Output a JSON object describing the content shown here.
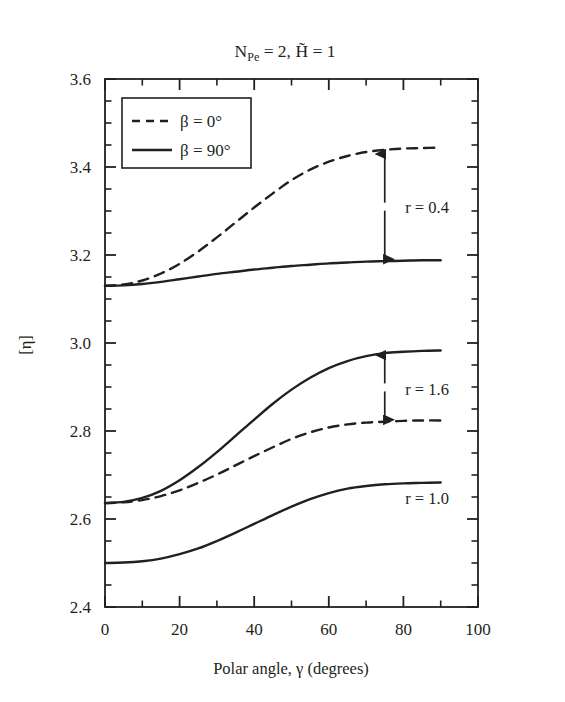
{
  "chart_data": {
    "type": "line",
    "title_parts": {
      "n_main": "N",
      "n_sub": "Pe",
      "n_eq": " = 2, ",
      "h_main": "H̃",
      "h_eq": " = 1"
    },
    "xlabel": "Polar angle, γ (degrees)",
    "ylabel": "[η]",
    "xlim": [
      0,
      100
    ],
    "ylim": [
      2.4,
      3.6
    ],
    "x_major_ticks": [
      0,
      20,
      40,
      60,
      80,
      100
    ],
    "x_tick_labels": [
      "0",
      "20",
      "40",
      "60",
      "80",
      "100"
    ],
    "x_minor_step": 10,
    "y_major_ticks": [
      2.4,
      2.6,
      2.8,
      3.0,
      3.2,
      3.4,
      3.6
    ],
    "y_tick_labels": [
      "2.4",
      "2.6",
      "2.8",
      "3.0",
      "3.2",
      "3.4",
      "3.6"
    ],
    "y_minor_step": 0.05,
    "grid": false,
    "legend_position": "upper left (inside axes)",
    "legend": [
      {
        "label": "β = 0°",
        "style": "dashed"
      },
      {
        "label": "β = 90°",
        "style": "solid"
      }
    ],
    "x": [
      0,
      5,
      10,
      15,
      20,
      25,
      30,
      35,
      40,
      45,
      50,
      55,
      60,
      65,
      70,
      75,
      80,
      85,
      90
    ],
    "series": [
      {
        "name": "r = 0.4, β = 0°",
        "group": "r = 0.4",
        "style": "dashed",
        "values": [
          3.13,
          3.133,
          3.142,
          3.158,
          3.18,
          3.208,
          3.24,
          3.274,
          3.308,
          3.34,
          3.37,
          3.394,
          3.412,
          3.425,
          3.434,
          3.439,
          3.442,
          3.443,
          3.444
        ]
      },
      {
        "name": "r = 0.4, β = 90°",
        "group": "r = 0.4",
        "style": "solid",
        "values": [
          3.13,
          3.131,
          3.134,
          3.139,
          3.145,
          3.151,
          3.157,
          3.162,
          3.167,
          3.171,
          3.175,
          3.178,
          3.181,
          3.183,
          3.185,
          3.186,
          3.187,
          3.188,
          3.188
        ]
      },
      {
        "name": "r = 1.6, β = 90°",
        "group": "r = 1.6",
        "style": "solid",
        "values": [
          2.636,
          2.639,
          2.648,
          2.664,
          2.688,
          2.718,
          2.752,
          2.789,
          2.826,
          2.862,
          2.894,
          2.921,
          2.943,
          2.959,
          2.97,
          2.977,
          2.98,
          2.982,
          2.983
        ]
      },
      {
        "name": "r = 1.6, β = 0°",
        "group": "r = 1.6",
        "style": "dashed",
        "values": [
          2.636,
          2.638,
          2.643,
          2.652,
          2.665,
          2.682,
          2.701,
          2.722,
          2.743,
          2.763,
          2.782,
          2.797,
          2.808,
          2.815,
          2.819,
          2.821,
          2.823,
          2.824,
          2.824
        ]
      },
      {
        "name": "r = 1.0",
        "group": "r = 1.0",
        "style": "solid",
        "values": [
          2.5,
          2.501,
          2.504,
          2.51,
          2.52,
          2.533,
          2.55,
          2.569,
          2.589,
          2.609,
          2.628,
          2.645,
          2.659,
          2.669,
          2.675,
          2.679,
          2.681,
          2.682,
          2.683
        ]
      }
    ],
    "annotations": [
      {
        "label": "r = 0.4",
        "type": "double-arrow",
        "x": 75,
        "y_top": 3.434,
        "y_bottom": 3.186,
        "text_x": 80.5,
        "text_y": 3.31
      },
      {
        "label": "r = 1.6",
        "type": "double-arrow",
        "x": 75,
        "y_top": 2.977,
        "y_bottom": 2.821,
        "text_x": 80.5,
        "text_y": 2.895
      },
      {
        "label": "r = 1.0",
        "type": "text",
        "x": 80.5,
        "y": 2.648
      }
    ]
  },
  "colors": {
    "ink": "#231f20",
    "background": "#ffffff"
  }
}
